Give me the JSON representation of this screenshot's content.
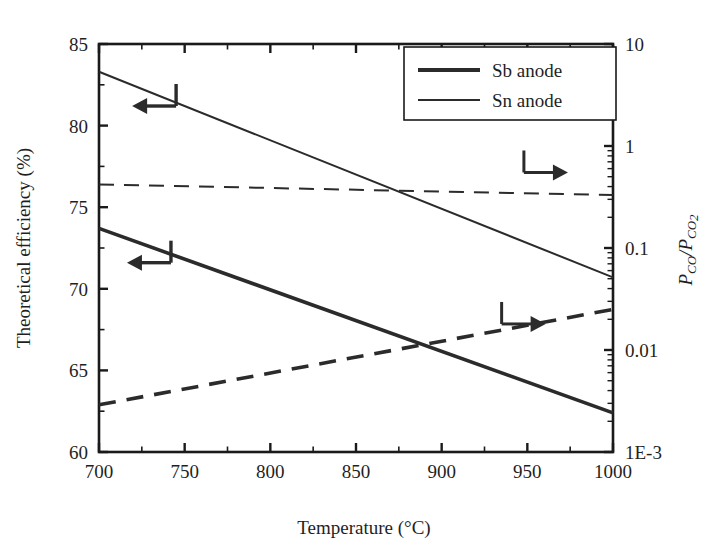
{
  "figure": {
    "background": "#ffffff",
    "line_color": "#2b2b2b",
    "frame_color": "#1a1a1a"
  },
  "axes": {
    "x": {
      "label": "Temperature (°C)",
      "unit": "°C",
      "min": 700,
      "max": 1000,
      "ticks": [
        700,
        750,
        800,
        850,
        900,
        950,
        1000
      ],
      "tick_labels": [
        "700",
        "750",
        "800",
        "850",
        "900",
        "950",
        "1000"
      ],
      "minor_step": 25
    },
    "y_left": {
      "label": "Theoretical efficiency (%)",
      "min": 60,
      "max": 85,
      "ticks": [
        60,
        65,
        70,
        75,
        80,
        85
      ],
      "tick_labels": [
        "60",
        "65",
        "70",
        "75",
        "80",
        "85"
      ],
      "minor_step": 2.5
    },
    "y_right": {
      "label_parts": {
        "p1": "P",
        "sub1": "CO",
        "slash": "/",
        "p2": "P",
        "sub2": "CO",
        "sub2b": "2"
      },
      "label_plain": "P_CO/P_CO2",
      "scale": "log",
      "min": 0.001,
      "max": 10,
      "ticks": [
        0.001,
        0.01,
        0.1,
        1,
        10
      ],
      "tick_labels": [
        "1E-3",
        "0.01",
        "0.1",
        "1",
        "10"
      ]
    }
  },
  "legend": {
    "position": "top-right",
    "entries": [
      {
        "label": "Sb anode",
        "style": "solid-thick",
        "width": 3.6
      },
      {
        "label": "Sn anode",
        "style": "solid-thin",
        "width": 1.8
      }
    ]
  },
  "annotations": [
    {
      "name": "arrow-left-upper",
      "direction": "left",
      "target_axis": "y_left",
      "x": 745,
      "y": 81.2
    },
    {
      "name": "arrow-left-lower",
      "direction": "left",
      "target_axis": "y_left",
      "x": 742,
      "y": 71.6
    },
    {
      "name": "arrow-right-upper",
      "direction": "right",
      "target_axis": "y_right",
      "x": 948,
      "y_value": 0.55
    },
    {
      "name": "arrow-right-lower",
      "direction": "right",
      "target_axis": "y_right",
      "x": 935,
      "y_value": 0.018
    }
  ],
  "chart_data": {
    "type": "line",
    "title": "",
    "xlabel": "Temperature (°C)",
    "ylabel": "Theoretical efficiency (%)",
    "ylabel_secondary": "P_CO/P_CO2",
    "xlim": [
      700,
      1000
    ],
    "ylim": [
      60,
      85
    ],
    "ylim_secondary": [
      0.001,
      10
    ],
    "yscale_secondary": "log",
    "grid": false,
    "legend_position": "top-right",
    "series": [
      {
        "name": "Sn anode — theoretical efficiency",
        "legend": "Sn anode",
        "axis": "left",
        "style": "solid",
        "linewidth": 2.0,
        "x": [
          700,
          1000
        ],
        "values": [
          83.3,
          70.7
        ]
      },
      {
        "name": "Sb anode — theoretical efficiency",
        "legend": "Sb anode",
        "axis": "left",
        "style": "solid",
        "linewidth": 3.6,
        "x": [
          700,
          1000
        ],
        "values": [
          73.7,
          62.4
        ]
      },
      {
        "name": "Sn anode — P_CO/P_CO2",
        "legend": "Sn anode",
        "axis": "right",
        "style": "dashed",
        "linewidth": 2.0,
        "x": [
          700,
          1000
        ],
        "values": [
          0.42,
          0.33
        ]
      },
      {
        "name": "Sb anode — P_CO/P_CO2",
        "legend": "Sb anode",
        "axis": "right",
        "style": "dashed",
        "linewidth": 3.6,
        "x": [
          700,
          1000
        ],
        "values": [
          0.0029,
          0.025
        ]
      }
    ]
  }
}
